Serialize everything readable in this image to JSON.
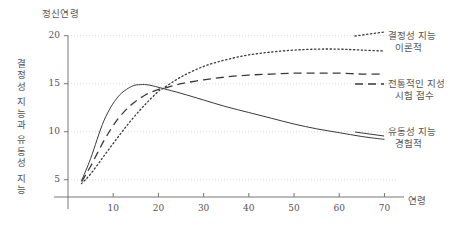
{
  "chart_data": {
    "type": "line",
    "title": "정신연령",
    "xlabel": "연령",
    "ylabel": "결정성 지능과 유동성 지능",
    "xlim": [
      0,
      73
    ],
    "ylim": [
      3.2,
      20.8
    ],
    "xticks": [
      "10",
      "20",
      "30",
      "40",
      "50",
      "60",
      "70"
    ],
    "xtick_values": [
      10,
      20,
      30,
      40,
      50,
      60,
      70
    ],
    "yticks": [
      "20",
      "15",
      "10",
      "5"
    ],
    "ytick_values": [
      20,
      15,
      10,
      5
    ],
    "grid": "horizontal-dotted",
    "legend_position": "right",
    "series": [
      {
        "name": "결정성 지능 이론적",
        "legend_line1": "결정성 지능",
        "legend_line2": "이론적",
        "style": "dotted",
        "color": "#3a3a3a",
        "x": [
          3,
          5,
          8,
          11,
          14,
          17,
          20,
          21,
          25,
          30,
          35,
          40,
          45,
          50,
          55,
          60,
          65,
          70
        ],
        "y": [
          4.6,
          5.6,
          7.5,
          9.4,
          11.2,
          12.8,
          14.2,
          14.5,
          15.7,
          16.8,
          17.5,
          18.0,
          18.3,
          18.5,
          18.6,
          18.6,
          18.5,
          18.4
        ]
      },
      {
        "name": "전통적인 지성 시험 점수",
        "legend_line1": "전통적인 지성",
        "legend_line2": "시험 점수",
        "style": "dashed",
        "color": "#3a3a3a",
        "x": [
          3,
          5,
          8,
          11,
          14,
          17,
          20,
          21,
          25,
          30,
          35,
          40,
          45,
          50,
          55,
          60,
          65,
          70
        ],
        "y": [
          4.8,
          6.4,
          9.1,
          11.3,
          12.8,
          13.8,
          14.4,
          14.5,
          15.0,
          15.4,
          15.7,
          15.9,
          16.0,
          16.1,
          16.1,
          16.1,
          16.0,
          16.0
        ]
      },
      {
        "name": "유동성 지능 경험적",
        "legend_line1": "유동성 지능",
        "legend_line2": "경험적",
        "style": "solid",
        "color": "#3a3a3a",
        "x": [
          3,
          5,
          8,
          11,
          14,
          16,
          18,
          21,
          25,
          30,
          35,
          40,
          45,
          50,
          55,
          60,
          65,
          70
        ],
        "y": [
          4.9,
          7.2,
          11.2,
          13.6,
          14.7,
          14.9,
          14.85,
          14.5,
          14.0,
          13.3,
          12.6,
          12.0,
          11.4,
          10.8,
          10.3,
          9.9,
          9.5,
          9.2
        ]
      }
    ]
  }
}
